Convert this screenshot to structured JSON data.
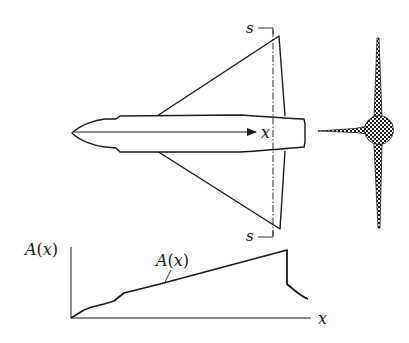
{
  "diagram": {
    "planform": {
      "axis_label": "x",
      "section_label_top": "s",
      "section_label_bottom": "s"
    },
    "cross_section": {
      "description": "hatched circular fuselage with thin wing and fin spikes"
    },
    "area_plot": {
      "y_axis_label_func": "A",
      "y_axis_label_open": "(",
      "y_axis_label_var": "x",
      "y_axis_label_close": ")",
      "curve_label_func": "A",
      "curve_label_open": "(",
      "curve_label_var": "x",
      "curve_label_close": ")",
      "x_axis_label": "x"
    },
    "colors": {
      "line": "#1a1a1a",
      "background": "#ffffff"
    }
  }
}
